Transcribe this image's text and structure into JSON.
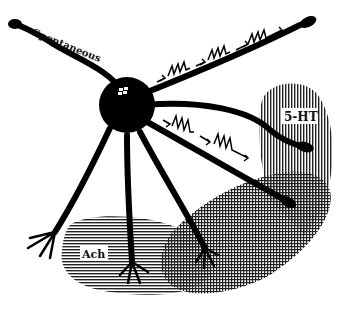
{
  "diagram": {
    "labels": {
      "spontaneous": "Spontaneous",
      "serotonin": "5-HT",
      "acetylcholine": "Ach"
    },
    "regions": [
      {
        "name": "5-HT",
        "pattern": "vertical-lines"
      },
      {
        "name": "Ach",
        "pattern": "horizontal-lines"
      },
      {
        "name": "overlap",
        "pattern": "crosshatch"
      }
    ],
    "colors": {
      "ink": "#000000",
      "background": "#ffffff"
    },
    "spike_trains": [
      {
        "dendrite": "upper-right",
        "groups": 3,
        "spikes_per_group": 3
      },
      {
        "dendrite": "lower-right",
        "groups": 2,
        "spikes_per_group": 3
      }
    ]
  }
}
